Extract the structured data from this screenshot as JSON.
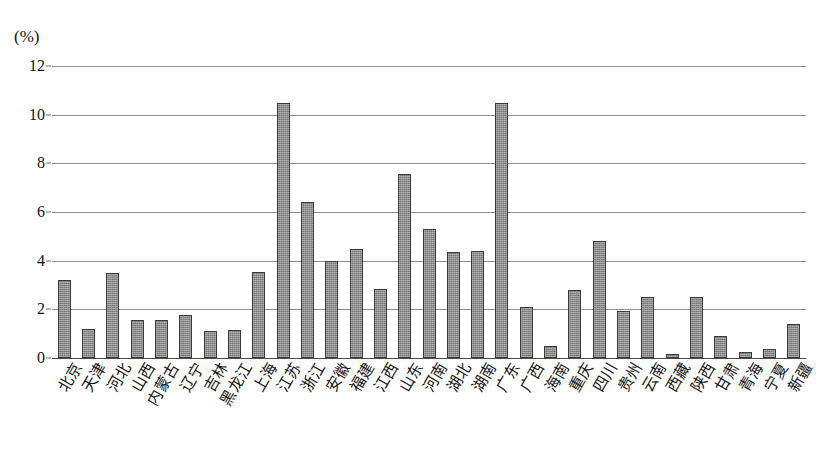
{
  "figure": {
    "unit_label": "(%)"
  },
  "chart_data": {
    "type": "bar",
    "title": "",
    "xlabel": "",
    "ylabel": "(%)",
    "ylim": [
      0,
      12
    ],
    "yticks": [
      0,
      2,
      4,
      6,
      8,
      10,
      12
    ],
    "ytick_labels": [
      "0",
      "2",
      "4",
      "6",
      "8",
      "10",
      "12"
    ],
    "grid": true,
    "legend": "none",
    "bar_color": "#8b8b8b",
    "bar_edge_color": "#3a3a3a",
    "categories": [
      "北京",
      "天津",
      "河北",
      "山西",
      "内蒙古",
      "辽宁",
      "吉林",
      "黑龙江",
      "上海",
      "江苏",
      "浙江",
      "安徽",
      "福建",
      "江西",
      "山东",
      "河南",
      "湖北",
      "湖南",
      "广东",
      "广西",
      "海南",
      "重庆",
      "四川",
      "贵州",
      "云南",
      "西藏",
      "陕西",
      "甘肃",
      "青海",
      "宁夏",
      "新疆"
    ],
    "values": [
      3.2,
      1.2,
      3.5,
      1.55,
      1.55,
      1.75,
      1.1,
      1.15,
      3.55,
      10.5,
      6.4,
      4.0,
      4.5,
      2.85,
      7.55,
      5.3,
      4.35,
      4.4,
      10.5,
      2.1,
      0.5,
      2.8,
      4.8,
      1.95,
      2.5,
      0.15,
      2.5,
      0.9,
      0.25,
      0.35,
      1.4
    ]
  }
}
